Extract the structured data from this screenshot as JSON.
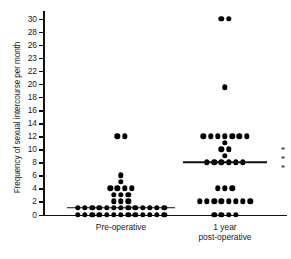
{
  "chart_data": {
    "type": "scatter",
    "title": "",
    "xlabel": "",
    "ylabel": "Frequency of sexual intercourse per month",
    "ylim": [
      0,
      30
    ],
    "grid": false,
    "legend": "none",
    "ytick_labels": [
      "0",
      "2",
      "4",
      "6",
      "8",
      "10",
      "12",
      "14",
      "16",
      "18",
      "20",
      "22",
      "23",
      "26",
      "28",
      "30"
    ],
    "ytick_values": [
      0,
      2,
      4,
      6,
      8,
      10,
      12,
      14,
      16,
      18,
      20,
      22,
      24,
      26,
      28,
      30
    ],
    "categories": [
      "Pre-operative",
      "1 year\npost-operative"
    ],
    "annotations": [
      "* * *"
    ],
    "series": [
      {
        "name": "Pre-operative",
        "median": 1,
        "points": [
          {
            "value": 12,
            "count": 2
          },
          {
            "value": 6,
            "count": 1
          },
          {
            "value": 5,
            "count": 1
          },
          {
            "value": 4,
            "count": 4
          },
          {
            "value": 3,
            "count": 3
          },
          {
            "value": 2,
            "count": 3
          },
          {
            "value": 1,
            "count": 13
          },
          {
            "value": 0,
            "count": 13
          }
        ]
      },
      {
        "name": "1 year post-operative",
        "median": 8,
        "points": [
          {
            "value": 30,
            "count": 2
          },
          {
            "value": 19.5,
            "count": 1
          },
          {
            "value": 12,
            "count": 7
          },
          {
            "value": 11,
            "count": 1
          },
          {
            "value": 10,
            "count": 2
          },
          {
            "value": 9,
            "count": 1
          },
          {
            "value": 8,
            "count": 6
          },
          {
            "value": 4,
            "count": 3
          },
          {
            "value": 2,
            "count": 8
          },
          {
            "value": 0,
            "count": 4
          }
        ]
      }
    ]
  },
  "axis": {
    "y_title": "Frequency of sexual intercourse per month"
  },
  "groups": [
    {
      "label": "Pre-operative"
    },
    {
      "label": "1 year\npost-operative"
    }
  ],
  "annotation": {
    "significance": "* * *"
  },
  "bottom_caption": {
    "text": ""
  }
}
